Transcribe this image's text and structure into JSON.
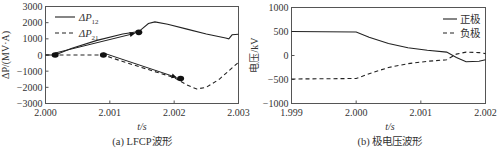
{
  "chart_data": [
    {
      "type": "line",
      "caption": "(a)  LFCP波形",
      "title": "",
      "xlabel": "t/s",
      "ylabel": "ΔP/(MV·A)",
      "xlim": [
        2.0,
        2.003
      ],
      "ylim": [
        -3000,
        3000
      ],
      "x_ticks": [
        2.0,
        2.001,
        2.002,
        2.003
      ],
      "x_tick_labels": [
        "2.000",
        "2.001",
        "2.002",
        "2.003"
      ],
      "y_ticks": [
        3000,
        2000,
        1000,
        0,
        -1000,
        -2000,
        -3000
      ],
      "y_tick_labels": [
        "3000",
        "2000",
        "1000",
        "0",
        "−1000",
        "−2000",
        "−3000"
      ],
      "grid": false,
      "legend_position": "top-left",
      "series": [
        {
          "name": "ΔP12",
          "name_main": "ΔP",
          "name_sub": "12",
          "style": "solid",
          "x": [
            2.0,
            2.00015,
            2.0004,
            2.0008,
            2.0012,
            2.00145,
            2.0016,
            2.0017,
            2.0019,
            2.0022,
            2.0025,
            2.0028,
            2.00285,
            2.0029,
            2.003
          ],
          "y": [
            0,
            0,
            400,
            900,
            1300,
            1450,
            1950,
            2050,
            1900,
            1600,
            1300,
            1050,
            1000,
            1250,
            1280
          ]
        },
        {
          "name": "ΔP21",
          "name_main": "ΔP",
          "name_sub": "21",
          "style": "dashed",
          "x": [
            2.0,
            2.0009,
            2.0012,
            2.0016,
            2.002,
            2.0022,
            2.00235,
            2.0025,
            2.0027,
            2.0029,
            2.003
          ],
          "y": [
            0,
            0,
            -400,
            -900,
            -1400,
            -1850,
            -2100,
            -2000,
            -1500,
            -800,
            -450
          ]
        }
      ],
      "annotations": [
        {
          "type": "arrow",
          "from": [
            2.00015,
            0
          ],
          "to": [
            2.00145,
            1400
          ]
        },
        {
          "type": "arrow",
          "from": [
            2.0009,
            0
          ],
          "to": [
            2.0021,
            -1450
          ]
        }
      ],
      "markers": [
        {
          "x": 2.00015,
          "y": 0
        },
        {
          "x": 2.00145,
          "y": 1400
        },
        {
          "x": 2.0009,
          "y": 0
        },
        {
          "x": 2.0021,
          "y": -1450
        }
      ]
    },
    {
      "type": "line",
      "caption": "(b)  极电压波形",
      "title": "",
      "xlabel": "t/s",
      "ylabel": "电压/kV",
      "xlim": [
        1.999,
        2.002
      ],
      "ylim": [
        -1000,
        1000
      ],
      "x_ticks": [
        1.999,
        2.0,
        2.001,
        2.002
      ],
      "x_tick_labels": [
        "1.999",
        "2.000",
        "2.001",
        "2.002"
      ],
      "y_ticks": [
        1000,
        500,
        0,
        -500,
        -1000
      ],
      "y_tick_labels": [
        "1000",
        "500",
        "0",
        "−500",
        "−1000"
      ],
      "grid": false,
      "legend_position": "top-right",
      "series": [
        {
          "name": "正极",
          "style": "solid",
          "x": [
            1.999,
            2.0,
            2.0002,
            2.0005,
            2.0008,
            2.0011,
            2.0014,
            2.00155,
            2.0017,
            2.0019,
            2.002
          ],
          "y": [
            500,
            490,
            380,
            250,
            160,
            110,
            70,
            -40,
            -130,
            -120,
            -90
          ]
        },
        {
          "name": "负极",
          "style": "dashed",
          "x": [
            1.999,
            2.0,
            2.0002,
            2.0005,
            2.0008,
            2.0011,
            2.0014,
            2.00155,
            2.0017,
            2.0019,
            2.002
          ],
          "y": [
            -490,
            -480,
            -380,
            -250,
            -170,
            -120,
            -90,
            30,
            70,
            60,
            40
          ]
        }
      ]
    }
  ]
}
